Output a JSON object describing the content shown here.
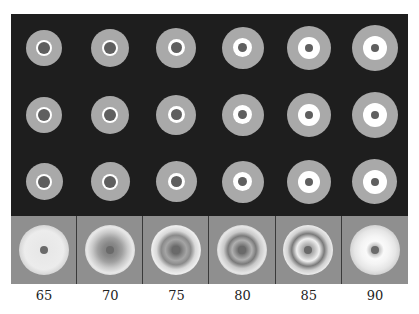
{
  "figure": {
    "rows": 3,
    "columns": 6,
    "background": "#1e1e1e",
    "disc_color": "#a9a9a9",
    "ring_color": "#ffffff",
    "center_color": "#5f5f5f",
    "top_rows": [
      [
        {
          "disc": 36,
          "ring": 16,
          "ring_w": 2
        },
        {
          "disc": 38,
          "ring": 16,
          "ring_w": 2
        },
        {
          "disc": 40,
          "ring": 17,
          "ring_w": 3
        },
        {
          "disc": 42,
          "ring": 19,
          "ring_w": 5
        },
        {
          "disc": 44,
          "ring": 22,
          "ring_w": 7
        },
        {
          "disc": 46,
          "ring": 24,
          "ring_w": 8
        }
      ],
      [
        {
          "disc": 36,
          "ring": 16,
          "ring_w": 2
        },
        {
          "disc": 38,
          "ring": 16,
          "ring_w": 2
        },
        {
          "disc": 40,
          "ring": 17,
          "ring_w": 3
        },
        {
          "disc": 42,
          "ring": 19,
          "ring_w": 5
        },
        {
          "disc": 44,
          "ring": 22,
          "ring_w": 7
        },
        {
          "disc": 46,
          "ring": 24,
          "ring_w": 8
        }
      ],
      [
        {
          "disc": 37,
          "ring": 16,
          "ring_w": 2
        },
        {
          "disc": 39,
          "ring": 16,
          "ring_w": 2
        },
        {
          "disc": 41,
          "ring": 17,
          "ring_w": 3
        },
        {
          "disc": 42,
          "ring": 19,
          "ring_w": 5
        },
        {
          "disc": 44,
          "ring": 22,
          "ring_w": 7
        },
        {
          "disc": 45,
          "ring": 24,
          "ring_w": 8
        }
      ]
    ],
    "bottom_row": {
      "background": "#8f8f8f",
      "gradients": [
        "radial-gradient(circle, #e6e6e6 0%, #ececec 55%, #cfcfcf 75%, #555 92%, #8f8f8f 100%)",
        "radial-gradient(circle, #777 0%, #888 20%, #a0a0a0 35%, #c8c8c8 50%, #e8e8e8 65%, #cfcfcf 78%, #555 92%, #8f8f8f 100%)",
        "radial-gradient(circle, #444 0%, #888 20%, #a5a5a5 30%, #8a8a8a 42%, #d8d8d8 55%, #eeeeee 68%, #bdbdbd 80%, #505050 92%, #8f8f8f 100%)",
        "radial-gradient(circle, #444 0%, #8a8a8a 18%, #b0b0b0 28%, #7a7a7a 40%, #c8c8c8 52%, #e6e6e6 66%, #bdbdbd 80%, #4e4e4e 92%, #8f8f8f 100%)",
        "radial-gradient(circle, #777 0%, #c8c8c8 22%, #f0f0f0 32%, #7a7a7a 46%, #d0d0d0 58%, #ebebeb 70%, #bdbdbd 82%, #505050 93%, #8f8f8f 100%)",
        "radial-gradient(circle, #888 0%, #fafafa 25%, #f4f4f4 40%, #e6e6e6 58%, #d0d0d0 72%, #9a9a9a 86%, #555 95%, #8f8f8f 100%)"
      ]
    },
    "labels": [
      "65",
      "70",
      "75",
      "80",
      "85",
      "90"
    ]
  }
}
